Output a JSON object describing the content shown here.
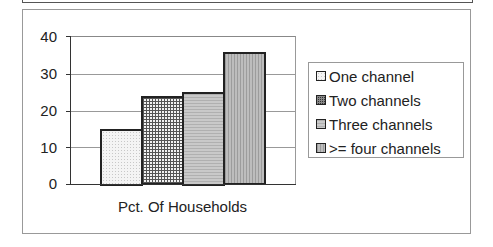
{
  "chart_data": {
    "type": "bar",
    "title": "",
    "xlabel": "Pct. Of Households",
    "ylabel": "",
    "ylim": [
      0,
      40
    ],
    "yticks": [
      "0",
      "10",
      "20",
      "30",
      "40"
    ],
    "grid": true,
    "legend_position": "right",
    "categories": [
      "Pct. Of Households"
    ],
    "series": [
      {
        "name": "One channel",
        "values": [
          15
        ],
        "pattern": "light-dots"
      },
      {
        "name": "Two channels",
        "values": [
          24
        ],
        "pattern": "crosshatch-grid"
      },
      {
        "name": "Three channels",
        "values": [
          25
        ],
        "pattern": "horizontal-stripes"
      },
      {
        "name": ">= four channels",
        "values": [
          35.7
        ],
        "pattern": "vertical-stripes"
      }
    ]
  },
  "axis": {
    "y_ticks": [
      "40",
      "30",
      "20",
      "10",
      "0"
    ],
    "x_label": "Pct. Of Households"
  },
  "legend": {
    "items": [
      {
        "label": "One channel"
      },
      {
        "label": "Two channels"
      },
      {
        "label": "Three channels"
      },
      {
        "label": ">= four channels"
      }
    ]
  }
}
